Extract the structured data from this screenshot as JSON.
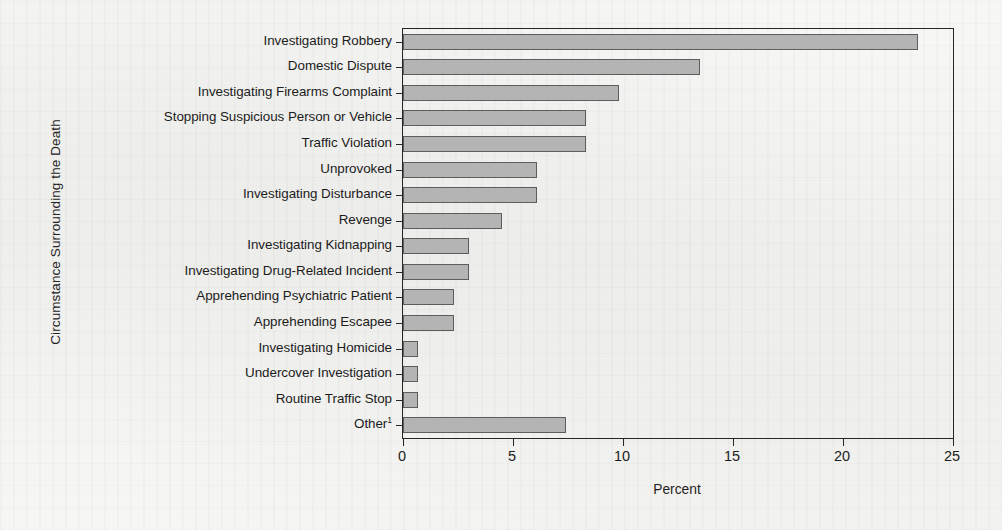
{
  "chart_data": {
    "type": "bar",
    "orientation": "horizontal",
    "title": "",
    "xlabel": "Percent",
    "ylabel": "Circumstance Surrounding the Death",
    "xlim": [
      0,
      25
    ],
    "xticks": [
      0,
      5,
      10,
      15,
      20,
      25
    ],
    "xtick_labels": [
      "0",
      "5",
      "10",
      "15",
      "20",
      "25"
    ],
    "grid": false,
    "legend": false,
    "bar_color": "#b4b4b4",
    "bar_edge_color": "#5d5d5d",
    "axis_color": "#262626",
    "categories": [
      "Investigating Robbery",
      "Domestic Dispute",
      "Investigating Firearms Complaint",
      "Stopping Suspicious Person or Vehicle",
      "Traffic Violation",
      "Unprovoked",
      "Investigating Disturbance",
      "Revenge",
      "Investigating Kidnapping",
      "Investigating Drug-Related Incident",
      "Apprehending Psychiatric Patient",
      "Apprehending Escapee",
      "Investigating Homicide",
      "Undercover Investigation",
      "Routine Traffic Stop",
      "Other"
    ],
    "category_footnote_markers": [
      "",
      "",
      "",
      "",
      "",
      "",
      "",
      "",
      "",
      "",
      "",
      "",
      "",
      "",
      "",
      "1"
    ],
    "values": [
      23.4,
      13.5,
      9.8,
      8.3,
      8.3,
      6.1,
      6.1,
      4.5,
      3.0,
      3.0,
      2.3,
      2.3,
      0.7,
      0.7,
      0.7,
      7.4
    ]
  }
}
